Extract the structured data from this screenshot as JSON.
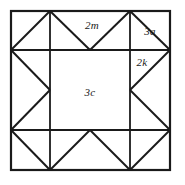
{
  "figure": {
    "type": "geometric-diagram",
    "background_color": "#ffffff",
    "line_color": "#1a1a1a",
    "outer_border": {
      "x": 11,
      "y": 11,
      "width": 159,
      "height": 159,
      "stroke_width": 2.2
    },
    "grid": {
      "x_positions": [
        11,
        50,
        130,
        170
      ],
      "y_positions": [
        11,
        50,
        130,
        170
      ],
      "stroke_width": 1.8
    },
    "diagonals": [
      {
        "name": "top-left-corner-diagonal",
        "x1": 50,
        "y1": 11,
        "x2": 11,
        "y2": 50
      },
      {
        "name": "top-star-point-left",
        "x1": 50,
        "y1": 11,
        "x2": 90,
        "y2": 50
      },
      {
        "name": "top-star-point-right",
        "x1": 130,
        "y1": 11,
        "x2": 90,
        "y2": 50
      },
      {
        "name": "top-right-corner-diagonal",
        "x1": 130,
        "y1": 11,
        "x2": 170,
        "y2": 50
      },
      {
        "name": "left-star-point-upper",
        "x1": 11,
        "y1": 50,
        "x2": 50,
        "y2": 90
      },
      {
        "name": "left-star-point-lower",
        "x1": 11,
        "y1": 130,
        "x2": 50,
        "y2": 90
      },
      {
        "name": "right-star-point-upper",
        "x1": 170,
        "y1": 50,
        "x2": 130,
        "y2": 90
      },
      {
        "name": "right-star-point-lower",
        "x1": 170,
        "y1": 130,
        "x2": 130,
        "y2": 90
      },
      {
        "name": "bottom-left-corner-diagonal",
        "x1": 11,
        "y1": 130,
        "x2": 50,
        "y2": 170
      },
      {
        "name": "bottom-star-point-left",
        "x1": 50,
        "y1": 170,
        "x2": 90,
        "y2": 130
      },
      {
        "name": "bottom-star-point-right",
        "x1": 130,
        "y1": 170,
        "x2": 90,
        "y2": 130
      },
      {
        "name": "bottom-right-corner-diagonal",
        "x1": 170,
        "y1": 130,
        "x2": 130,
        "y2": 170
      }
    ],
    "labels": [
      {
        "id": "label-2m",
        "text": "2m",
        "x": 92,
        "y": 25,
        "region": "top-edge-triangle"
      },
      {
        "id": "label-3a",
        "text": "3a",
        "x": 150,
        "y": 31,
        "region": "top-right-corner-square"
      },
      {
        "id": "label-2k",
        "text": "2k",
        "x": 142,
        "y": 62,
        "region": "right-edge-upper-triangle"
      },
      {
        "id": "label-3c",
        "text": "3c",
        "x": 90,
        "y": 92,
        "region": "center-square"
      }
    ]
  }
}
